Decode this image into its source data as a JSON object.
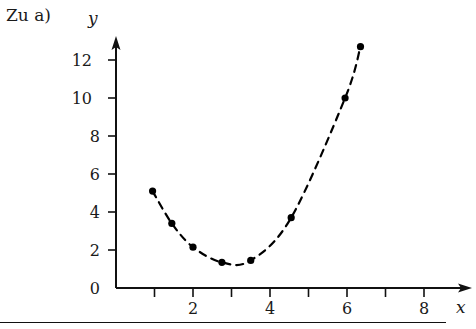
{
  "caption": "Zu a)",
  "axes": {
    "x_name": "x",
    "y_name": "y",
    "x_ticks_labeled": [
      "2",
      "4",
      "6",
      "8"
    ],
    "y_ticks_labeled": [
      "0",
      "2",
      "4",
      "6",
      "8",
      "10",
      "12"
    ]
  },
  "chart_data": {
    "type": "scatter",
    "title": "Zu a)",
    "xlabel": "x",
    "ylabel": "y",
    "xlim": [
      0,
      8.6
    ],
    "ylim": [
      0,
      13.4
    ],
    "grid": false,
    "legend": null,
    "connector": "dashed-curve",
    "marker": "filled-circle",
    "marker_color": "#000000",
    "line_color": "#000000",
    "x_tick_values": [
      1,
      2,
      3,
      4,
      5,
      6,
      7,
      8
    ],
    "x_tick_labels": {
      "2": "2",
      "4": "4",
      "6": "6",
      "8": "8"
    },
    "y_tick_values": [
      0,
      2,
      4,
      6,
      8,
      10,
      12
    ],
    "y_tick_labels": {
      "0": "0",
      "2": "2",
      "4": "4",
      "6": "6",
      "8": "8",
      "10": "10",
      "12": "12"
    },
    "points": [
      {
        "x": 0.95,
        "y": 5.1
      },
      {
        "x": 1.45,
        "y": 3.4
      },
      {
        "x": 2.0,
        "y": 2.15
      },
      {
        "x": 2.75,
        "y": 1.35
      },
      {
        "x": 3.5,
        "y": 1.45
      },
      {
        "x": 4.55,
        "y": 3.7
      },
      {
        "x": 5.95,
        "y": 10.0
      },
      {
        "x": 6.35,
        "y": 12.7
      }
    ],
    "x": [
      0.95,
      1.45,
      2.0,
      2.75,
      3.5,
      4.55,
      5.95,
      6.35
    ],
    "values": [
      5.1,
      3.4,
      2.15,
      1.35,
      1.45,
      3.7,
      10.0,
      12.7
    ]
  }
}
